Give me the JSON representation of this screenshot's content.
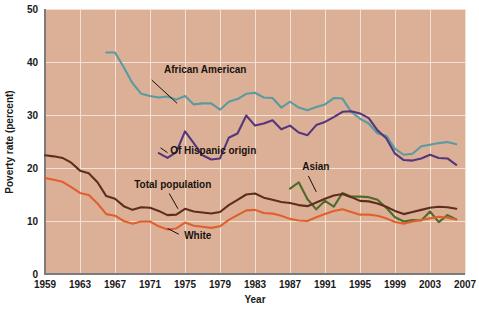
{
  "figure": {
    "background_color": "#ffffff",
    "plot_background_color": "#dcb096",
    "grid_color": "#f2e2d4",
    "axis_color": "#7c7c7c"
  },
  "chart_data": {
    "type": "line",
    "title": "",
    "xlabel": "Year",
    "ylabel": "Poverty rate (percent)",
    "xlim": [
      1959,
      2007
    ],
    "ylim": [
      0,
      50
    ],
    "xticks": [
      1959,
      1963,
      1967,
      1971,
      1975,
      1979,
      1983,
      1987,
      1991,
      1995,
      1999,
      2003,
      2007
    ],
    "yticks": [
      0,
      10,
      20,
      30,
      40,
      50
    ],
    "grid": true,
    "legend_position": "inline-annotations",
    "series": [
      {
        "name": "African American",
        "color": "#5b9aa0",
        "label_x": 1972.6,
        "label_y": 38.0,
        "leader_from_x": 1971.2,
        "leader_from_y": 36.6,
        "leader_to_x": 1974.1,
        "leader_to_y": 32.2,
        "x": [
          1966,
          1967,
          1968,
          1969,
          1970,
          1971,
          1972,
          1973,
          1974,
          1975,
          1976,
          1977,
          1978,
          1979,
          1980,
          1981,
          1982,
          1983,
          1984,
          1985,
          1986,
          1987,
          1988,
          1989,
          1990,
          1991,
          1992,
          1993,
          1994,
          1995,
          1996,
          1997,
          1998,
          1999,
          2000,
          2001,
          2002,
          2003,
          2004,
          2005,
          2006
        ],
        "values": [
          41.8,
          41.8,
          39.0,
          36.0,
          34.0,
          33.6,
          33.3,
          33.5,
          32.9,
          33.6,
          32.0,
          32.2,
          32.2,
          31.0,
          32.5,
          33.0,
          34.0,
          34.2,
          33.3,
          33.2,
          31.4,
          32.5,
          31.4,
          30.9,
          31.5,
          32.0,
          33.2,
          33.1,
          30.6,
          29.3,
          28.4,
          26.5,
          26.1,
          23.6,
          22.5,
          22.7,
          24.1,
          24.4,
          24.7,
          24.9,
          24.5
        ]
      },
      {
        "name": "Of Hispanic origin",
        "color": "#55367b",
        "label_x": 1973.3,
        "label_y": 22.6,
        "leader_from_x": 1972.2,
        "leader_from_y": 23.8,
        "leader_to_x": 1973.0,
        "leader_to_y": 22.9,
        "x": [
          1972,
          1973,
          1974,
          1975,
          1976,
          1977,
          1978,
          1979,
          1980,
          1981,
          1982,
          1983,
          1984,
          1985,
          1986,
          1987,
          1988,
          1989,
          1990,
          1991,
          1992,
          1993,
          1994,
          1995,
          1996,
          1997,
          1998,
          1999,
          2000,
          2001,
          2002,
          2003,
          2004,
          2005,
          2006
        ],
        "values": [
          22.8,
          21.9,
          23.0,
          26.9,
          24.7,
          22.4,
          21.6,
          21.8,
          25.7,
          26.5,
          29.9,
          28.0,
          28.4,
          29.0,
          27.3,
          28.0,
          26.7,
          26.2,
          28.1,
          28.7,
          29.6,
          30.6,
          30.7,
          30.3,
          29.4,
          27.1,
          25.6,
          22.7,
          21.5,
          21.4,
          21.8,
          22.5,
          21.9,
          21.8,
          20.6
        ]
      },
      {
        "name": "Asian",
        "color": "#4d6b2a",
        "label_x": 1988.4,
        "label_y": 19.6,
        "leader_from_x": 1989.1,
        "leader_from_y": 18.5,
        "leader_to_x": 1990.0,
        "leader_to_y": 15.5,
        "x": [
          1987,
          1988,
          1989,
          1990,
          1991,
          1992,
          1993,
          1994,
          1995,
          1996,
          1997,
          1998,
          1999,
          2000,
          2001,
          2002,
          2003,
          2004,
          2005,
          2006
        ],
        "values": [
          16.1,
          17.3,
          14.1,
          12.2,
          13.8,
          12.7,
          15.3,
          14.6,
          14.6,
          14.5,
          14.0,
          12.5,
          10.7,
          9.9,
          10.2,
          10.1,
          11.8,
          9.8,
          11.1,
          10.3
        ]
      },
      {
        "name": "Total population",
        "color": "#5e2d1d",
        "label_x": 1969.2,
        "label_y": 16.3,
        "leader_from_x": 1973.2,
        "leader_from_y": 15.2,
        "leader_to_x": 1974.2,
        "leader_to_y": 12.3,
        "x": [
          1959,
          1960,
          1961,
          1962,
          1963,
          1964,
          1965,
          1966,
          1967,
          1968,
          1969,
          1970,
          1971,
          1972,
          1973,
          1974,
          1975,
          1976,
          1977,
          1978,
          1979,
          1980,
          1981,
          1982,
          1983,
          1984,
          1985,
          1986,
          1987,
          1988,
          1989,
          1990,
          1991,
          1992,
          1993,
          1994,
          1995,
          1996,
          1997,
          1998,
          1999,
          2000,
          2001,
          2002,
          2003,
          2004,
          2005,
          2006
        ],
        "values": [
          22.4,
          22.2,
          21.9,
          21.0,
          19.5,
          19.0,
          17.3,
          14.7,
          14.2,
          12.8,
          12.1,
          12.6,
          12.5,
          11.9,
          11.1,
          11.2,
          12.3,
          11.8,
          11.6,
          11.4,
          11.7,
          13.0,
          14.0,
          15.0,
          15.2,
          14.4,
          14.0,
          13.6,
          13.4,
          13.0,
          12.8,
          13.5,
          14.2,
          14.8,
          15.1,
          14.5,
          13.8,
          13.7,
          13.3,
          12.7,
          11.9,
          11.3,
          11.7,
          12.1,
          12.5,
          12.7,
          12.6,
          12.3
        ]
      },
      {
        "name": "White",
        "color": "#e0602d",
        "label_x": 1974.9,
        "label_y": 6.6,
        "leader_from_x": 1974.3,
        "leader_from_y": 7.5,
        "leader_to_x": 1973.0,
        "leader_to_y": 8.6,
        "x": [
          1959,
          1960,
          1961,
          1962,
          1963,
          1964,
          1965,
          1966,
          1967,
          1968,
          1969,
          1970,
          1971,
          1972,
          1973,
          1974,
          1975,
          1976,
          1977,
          1978,
          1979,
          1980,
          1981,
          1982,
          1983,
          1984,
          1985,
          1986,
          1987,
          1988,
          1989,
          1990,
          1991,
          1992,
          1993,
          1994,
          1995,
          1996,
          1997,
          1998,
          1999,
          2000,
          2001,
          2002,
          2003,
          2004,
          2005,
          2006
        ],
        "values": [
          18.1,
          17.8,
          17.4,
          16.4,
          15.3,
          14.9,
          13.3,
          11.3,
          11.0,
          10.0,
          9.5,
          9.9,
          9.9,
          9.0,
          8.4,
          8.6,
          9.7,
          9.1,
          8.9,
          8.7,
          9.0,
          10.2,
          11.1,
          12.0,
          12.1,
          11.5,
          11.4,
          11.0,
          10.4,
          10.1,
          10.0,
          10.7,
          11.3,
          11.9,
          12.2,
          11.7,
          11.2,
          11.2,
          11.0,
          10.5,
          9.8,
          9.5,
          9.9,
          10.2,
          10.5,
          10.8,
          10.6,
          10.3
        ]
      }
    ]
  }
}
